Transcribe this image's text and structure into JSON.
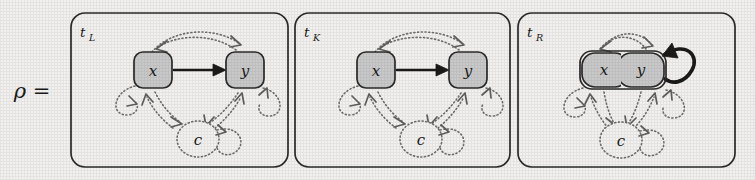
{
  "figure": {
    "kind": "graph-transformation-rule",
    "equation_label": "ρ =",
    "background_color": "#f2f1ef",
    "ink_color": "#1a1a1a",
    "node_fill_color": "#c9c9c9",
    "dotted_color": "#6e6e6e",
    "panels": [
      {
        "id": "tL",
        "label": "t",
        "subscript": "L",
        "nodes": [
          {
            "id": "x",
            "label": "x",
            "shape": "rounded-square",
            "style": "solid-filled"
          },
          {
            "id": "y",
            "label": "y",
            "shape": "rounded-square",
            "style": "solid-filled"
          },
          {
            "id": "c",
            "label": "c",
            "shape": "circle",
            "style": "dotted-open"
          }
        ],
        "edges": [
          {
            "from": "x",
            "to": "y",
            "style": "solid",
            "route": "straight"
          },
          {
            "from": "x",
            "to": "y",
            "style": "dotted",
            "route": "arc-over"
          },
          {
            "from": "y",
            "to": "x",
            "style": "dotted",
            "route": "arc-over"
          },
          {
            "from": "x",
            "to": "x",
            "style": "dotted",
            "route": "self-loop-left"
          },
          {
            "from": "y",
            "to": "y",
            "style": "dotted",
            "route": "self-loop-right"
          },
          {
            "from": "c",
            "to": "c",
            "style": "dotted",
            "route": "self-loop-right"
          },
          {
            "from": "x",
            "to": "c",
            "style": "dotted",
            "route": "straight"
          },
          {
            "from": "c",
            "to": "x",
            "style": "dotted",
            "route": "straight"
          },
          {
            "from": "y",
            "to": "c",
            "style": "dotted",
            "route": "straight"
          },
          {
            "from": "c",
            "to": "y",
            "style": "dotted",
            "route": "straight"
          }
        ]
      },
      {
        "id": "tK",
        "label": "t",
        "subscript": "K",
        "nodes": [
          {
            "id": "x",
            "label": "x",
            "shape": "rounded-square",
            "style": "solid-filled"
          },
          {
            "id": "y",
            "label": "y",
            "shape": "rounded-square",
            "style": "solid-filled"
          },
          {
            "id": "c",
            "label": "c",
            "shape": "circle",
            "style": "dotted-open"
          }
        ],
        "edges": [
          {
            "from": "x",
            "to": "y",
            "style": "solid",
            "route": "straight"
          },
          {
            "from": "x",
            "to": "y",
            "style": "dotted",
            "route": "arc-over"
          },
          {
            "from": "y",
            "to": "x",
            "style": "dotted",
            "route": "arc-over"
          },
          {
            "from": "x",
            "to": "x",
            "style": "dotted",
            "route": "self-loop-left"
          },
          {
            "from": "y",
            "to": "y",
            "style": "dotted",
            "route": "self-loop-right"
          },
          {
            "from": "c",
            "to": "c",
            "style": "dotted",
            "route": "self-loop-right"
          },
          {
            "from": "x",
            "to": "c",
            "style": "dotted",
            "route": "straight"
          },
          {
            "from": "c",
            "to": "x",
            "style": "dotted",
            "route": "straight"
          },
          {
            "from": "y",
            "to": "c",
            "style": "dotted",
            "route": "straight"
          },
          {
            "from": "c",
            "to": "y",
            "style": "dotted",
            "route": "straight"
          }
        ]
      },
      {
        "id": "tR",
        "label": "t",
        "subscript": "R",
        "nodes": [
          {
            "id": "xy",
            "label": "x y",
            "parts": [
              "x",
              "y"
            ],
            "shape": "merged-rounded-square",
            "style": "solid-filled"
          },
          {
            "id": "c",
            "label": "c",
            "shape": "circle",
            "style": "dotted-open"
          }
        ],
        "edges": [
          {
            "from": "xy",
            "to": "xy",
            "style": "solid-thick",
            "route": "self-loop-right"
          },
          {
            "from": "xy",
            "to": "xy",
            "style": "dotted",
            "route": "arc-over"
          },
          {
            "from": "xy",
            "to": "xy",
            "style": "dotted",
            "route": "self-loop-left"
          },
          {
            "from": "xy",
            "to": "xy",
            "style": "dotted",
            "route": "self-loop-right-lower"
          },
          {
            "from": "c",
            "to": "c",
            "style": "dotted",
            "route": "self-loop-right"
          },
          {
            "from": "xy",
            "to": "c",
            "style": "dotted",
            "route": "straight"
          },
          {
            "from": "c",
            "to": "xy",
            "style": "dotted",
            "route": "straight"
          }
        ]
      }
    ]
  }
}
